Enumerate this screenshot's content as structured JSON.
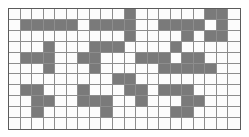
{
  "figure": {
    "name": "grid-pattern",
    "type": "binary-cell-grid",
    "columns": 20,
    "rows": 11,
    "colors": {
      "filled": "#7a7a7a",
      "empty": "#fcfcfc",
      "gridline": "#8d8d8d",
      "border": "#5b5b5b",
      "page_background": "#ffffff"
    },
    "legend": {
      "filled_label": "shaded cell",
      "empty_label": "empty cell"
    }
  },
  "chart_data": {
    "type": "heatmap",
    "title": "",
    "subtitle": "",
    "xlabel": "",
    "ylabel": "",
    "grid": true,
    "legend_position": "none",
    "ncols": 20,
    "nrows": 11,
    "value_labels": {
      "0": "empty",
      "1": "shaded"
    },
    "x": [
      1,
      2,
      3,
      4,
      5,
      6,
      7,
      8,
      9,
      10,
      11,
      12,
      13,
      14,
      15,
      16,
      17,
      18,
      19,
      20
    ],
    "y": [
      1,
      2,
      3,
      4,
      5,
      6,
      7,
      8,
      9,
      10,
      11
    ],
    "xticklabels": [],
    "yticklabels": [],
    "matrix": [
      [
        0,
        0,
        0,
        0,
        0,
        0,
        0,
        0,
        0,
        0,
        1,
        0,
        0,
        0,
        0,
        0,
        0,
        1,
        1,
        0
      ],
      [
        0,
        1,
        1,
        1,
        1,
        1,
        0,
        1,
        1,
        1,
        1,
        0,
        0,
        1,
        1,
        1,
        1,
        0,
        1,
        0
      ],
      [
        0,
        0,
        0,
        0,
        0,
        0,
        0,
        0,
        0,
        0,
        1,
        0,
        0,
        0,
        0,
        1,
        0,
        1,
        1,
        0
      ],
      [
        0,
        0,
        0,
        1,
        0,
        0,
        0,
        1,
        1,
        1,
        0,
        0,
        0,
        0,
        1,
        0,
        0,
        0,
        0,
        0
      ],
      [
        0,
        1,
        1,
        1,
        0,
        0,
        1,
        1,
        0,
        0,
        0,
        1,
        1,
        1,
        0,
        1,
        1,
        0,
        0,
        0
      ],
      [
        0,
        0,
        0,
        1,
        0,
        0,
        0,
        1,
        0,
        0,
        0,
        0,
        0,
        1,
        1,
        1,
        1,
        1,
        0,
        0
      ],
      [
        0,
        0,
        0,
        0,
        0,
        0,
        0,
        0,
        0,
        1,
        1,
        0,
        0,
        0,
        0,
        0,
        0,
        0,
        0,
        0
      ],
      [
        0,
        1,
        1,
        0,
        0,
        0,
        1,
        0,
        0,
        0,
        1,
        1,
        0,
        1,
        1,
        1,
        0,
        0,
        0,
        0
      ],
      [
        0,
        0,
        1,
        1,
        0,
        0,
        1,
        1,
        1,
        0,
        0,
        1,
        0,
        0,
        0,
        1,
        1,
        0,
        0,
        0
      ],
      [
        0,
        0,
        1,
        0,
        0,
        0,
        0,
        0,
        1,
        0,
        0,
        0,
        0,
        0,
        1,
        1,
        0,
        0,
        0,
        0
      ],
      [
        0,
        0,
        0,
        0,
        0,
        0,
        0,
        0,
        0,
        0,
        0,
        0,
        0,
        0,
        0,
        0,
        0,
        0,
        0,
        0
      ]
    ],
    "row_counts": [
      3,
      12,
      5,
      5,
      9,
      7,
      2,
      8,
      8,
      4,
      0
    ],
    "column_counts": [
      0,
      3,
      5,
      5,
      1,
      1,
      4,
      5,
      3,
      3,
      5,
      4,
      1,
      4,
      5,
      7,
      4,
      2,
      3,
      0
    ],
    "total_filled": 63,
    "total_cells": 220
  }
}
